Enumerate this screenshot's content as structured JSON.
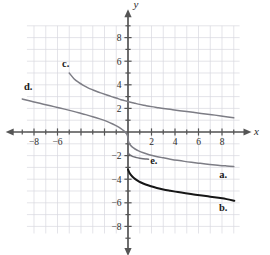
{
  "figure": {
    "background_color": "#ffffff",
    "axis_label_x": "x",
    "axis_label_y": "y"
  },
  "chart_data": {
    "type": "line",
    "title": "",
    "subtitle": "",
    "xlabel": "x",
    "ylabel": "y",
    "xlim": [
      -9.4,
      9.4
    ],
    "ylim": [
      -9.4,
      9.4
    ],
    "grid": true,
    "grid_color": "#d9d9e0",
    "grid_step": 1,
    "legend_position": "inline-annotations",
    "axis_color": "#555555",
    "xticks": [
      -8,
      -6,
      -4,
      -2,
      2,
      4,
      6,
      8
    ],
    "yticks": [
      -8,
      -6,
      -4,
      -2,
      2,
      4,
      6,
      8
    ],
    "xtick_labels": [
      "−8",
      "−6",
      "−4",
      "−2",
      "2",
      "4",
      "6",
      "8"
    ],
    "ytick_labels": [
      "−8",
      "−6",
      "−4",
      "−2",
      "2",
      "4",
      "6",
      "8"
    ],
    "xtick_labels_shown": [
      "−8",
      "−6",
      "2",
      "4",
      "6",
      "8"
    ],
    "ytick_labels_shown": [
      "8",
      "6",
      "4",
      "2",
      "−2",
      "−4",
      "−6",
      "−8"
    ],
    "minor_tick_step": 1,
    "series": [
      {
        "name": "c.",
        "label": "c.",
        "color": "#7d7d85",
        "width": 1.5,
        "label_x": -5.3,
        "label_y": 5.5,
        "points": [
          [
            -5.0,
            5.0
          ],
          [
            -4.6,
            4.52
          ],
          [
            -4.2,
            4.2
          ],
          [
            -3.8,
            3.95
          ],
          [
            -3.4,
            3.74
          ],
          [
            -3.0,
            3.57
          ],
          [
            -2.6,
            3.41
          ],
          [
            -2.2,
            3.27
          ],
          [
            -1.8,
            3.13
          ],
          [
            -1.4,
            3.0
          ],
          [
            -1.0,
            2.88
          ],
          [
            -0.6,
            2.74
          ],
          [
            -0.3,
            2.66
          ],
          [
            0.0,
            2.58
          ],
          [
            0.3,
            2.5
          ],
          [
            0.6,
            2.43
          ],
          [
            1.0,
            2.34
          ],
          [
            1.5,
            2.24
          ],
          [
            2.0,
            2.15
          ],
          [
            2.6,
            2.06
          ],
          [
            3.2,
            1.97
          ],
          [
            3.8,
            1.89
          ],
          [
            4.4,
            1.81
          ],
          [
            5.0,
            1.73
          ],
          [
            5.8,
            1.63
          ],
          [
            6.6,
            1.53
          ],
          [
            7.4,
            1.43
          ],
          [
            8.2,
            1.32
          ],
          [
            9.0,
            1.2
          ]
        ]
      },
      {
        "name": "d.",
        "label": "d.",
        "color": "#7d7d85",
        "width": 1.5,
        "label_x": -8.5,
        "label_y": 3.6,
        "points": [
          [
            -9.0,
            2.8
          ],
          [
            -8.4,
            2.64
          ],
          [
            -7.8,
            2.5
          ],
          [
            -7.2,
            2.36
          ],
          [
            -6.6,
            2.22
          ],
          [
            -6.0,
            2.08
          ],
          [
            -5.4,
            1.94
          ],
          [
            -4.8,
            1.79
          ],
          [
            -4.2,
            1.63
          ],
          [
            -3.6,
            1.47
          ],
          [
            -3.0,
            1.3
          ],
          [
            -2.4,
            1.11
          ],
          [
            -1.8,
            0.9
          ],
          [
            -1.3,
            0.68
          ],
          [
            -0.9,
            0.47
          ],
          [
            -0.6,
            0.28
          ],
          [
            -0.35,
            0.09
          ],
          [
            -0.18,
            -0.08
          ],
          [
            -0.08,
            -0.22
          ],
          [
            -0.03,
            -0.36
          ],
          [
            0.0,
            -0.55
          ],
          [
            0.03,
            -0.74
          ],
          [
            0.08,
            -0.92
          ],
          [
            0.18,
            -1.08
          ],
          [
            0.35,
            -1.26
          ],
          [
            0.6,
            -1.44
          ],
          [
            0.9,
            -1.6
          ],
          [
            1.3,
            -1.76
          ],
          [
            1.8,
            -1.92
          ],
          [
            2.4,
            -2.07
          ],
          [
            3.0,
            -2.19
          ],
          [
            3.6,
            -2.3
          ],
          [
            4.2,
            -2.4
          ],
          [
            4.8,
            -2.49
          ],
          [
            5.4,
            -2.57
          ],
          [
            6.0,
            -2.64
          ],
          [
            6.6,
            -2.71
          ],
          [
            7.2,
            -2.77
          ],
          [
            7.8,
            -2.83
          ],
          [
            8.4,
            -2.88
          ],
          [
            9.0,
            -2.93
          ]
        ]
      },
      {
        "name": "a.",
        "label": "a.",
        "color": "#7d7d85",
        "width": 1.5,
        "label_x": 8.1,
        "label_y": -3.9,
        "points": []
      },
      {
        "name": "e.",
        "label": "e.",
        "color": "#6e6e76",
        "width": 1.5,
        "label_x": 2.2,
        "label_y": -2.75,
        "points": [
          [
            0.0,
            -1.72
          ],
          [
            0.04,
            -1.8
          ],
          [
            0.1,
            -1.88
          ],
          [
            0.2,
            -1.96
          ],
          [
            0.34,
            -2.04
          ],
          [
            0.52,
            -2.11
          ],
          [
            0.74,
            -2.17
          ],
          [
            1.0,
            -2.22
          ],
          [
            1.28,
            -2.26
          ],
          [
            1.55,
            -2.29
          ],
          [
            1.75,
            -2.31
          ]
        ]
      },
      {
        "name": "b.",
        "label": "b.",
        "color": "#161616",
        "width": 2.0,
        "label_x": 8.1,
        "label_y": -6.7,
        "points": [
          [
            0.0,
            -3.18
          ],
          [
            0.12,
            -3.45
          ],
          [
            0.28,
            -3.68
          ],
          [
            0.5,
            -3.9
          ],
          [
            0.78,
            -4.1
          ],
          [
            1.1,
            -4.28
          ],
          [
            1.5,
            -4.45
          ],
          [
            1.95,
            -4.6
          ],
          [
            2.45,
            -4.74
          ],
          [
            3.0,
            -4.87
          ],
          [
            3.6,
            -4.98
          ],
          [
            4.25,
            -5.09
          ],
          [
            4.9,
            -5.19
          ],
          [
            5.6,
            -5.29
          ],
          [
            6.3,
            -5.39
          ],
          [
            7.0,
            -5.48
          ],
          [
            7.7,
            -5.58
          ],
          [
            8.4,
            -5.69
          ],
          [
            9.05,
            -5.82
          ]
        ]
      }
    ]
  }
}
